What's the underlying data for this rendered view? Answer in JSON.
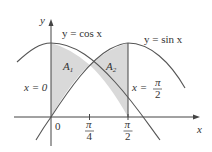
{
  "figure": {
    "axes": {
      "x_label": "x",
      "y_label": "y",
      "origin_label": "0"
    },
    "curves": [
      {
        "name": "cos",
        "label": "y = cos x"
      },
      {
        "name": "sin",
        "label": "y = sin x"
      }
    ],
    "regions": [
      {
        "name": "A1",
        "label": "A",
        "sub": "1"
      },
      {
        "name": "A2",
        "label": "A",
        "sub": "2"
      }
    ],
    "vertical_lines": [
      {
        "label_left": "x = 0"
      },
      {
        "label_left": "x =",
        "frac_num": "π",
        "frac_den": "2"
      }
    ],
    "ticks": [
      {
        "num": "π",
        "den": "4"
      },
      {
        "num": "π",
        "den": "2"
      }
    ],
    "colors": {
      "curve": "#555555",
      "shade": "#d9d9d9",
      "axis": "#444444"
    }
  }
}
